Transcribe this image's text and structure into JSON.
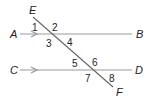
{
  "diagram": {
    "type": "parallel-lines-cut-by-transversal",
    "points": {
      "E": {
        "label": "E",
        "x": 29,
        "y": 14
      },
      "F": {
        "label": "F",
        "x": 116,
        "y": 96
      },
      "A": {
        "label": "A",
        "x": 10,
        "y": 38
      },
      "B": {
        "label": "B",
        "x": 136,
        "y": 38
      },
      "C": {
        "label": "C",
        "x": 10,
        "y": 74
      },
      "D": {
        "label": "D",
        "x": 135,
        "y": 74
      }
    },
    "lines": [
      {
        "name": "AB",
        "x1": 20,
        "y1": 34,
        "x2": 132,
        "y2": 34,
        "arrow_x": 36
      },
      {
        "name": "CD",
        "x1": 20,
        "y1": 70,
        "x2": 132,
        "y2": 70,
        "arrow_x": 36
      }
    ],
    "transversal": {
      "name": "EF",
      "x1": 33,
      "y1": 17,
      "x2": 113,
      "y2": 87
    },
    "angles": [
      {
        "label": "1",
        "x": 32,
        "y": 31
      },
      {
        "label": "2",
        "x": 52,
        "y": 31
      },
      {
        "label": "3",
        "x": 46,
        "y": 47
      },
      {
        "label": "4",
        "x": 67,
        "y": 46
      },
      {
        "label": "5",
        "x": 72,
        "y": 67
      },
      {
        "label": "6",
        "x": 92,
        "y": 66
      },
      {
        "label": "7",
        "x": 85,
        "y": 82
      },
      {
        "label": "8",
        "x": 109,
        "y": 82
      }
    ],
    "colors": {
      "line": "#9a9a9a",
      "transversal": "#666666",
      "text": "#222222"
    }
  }
}
